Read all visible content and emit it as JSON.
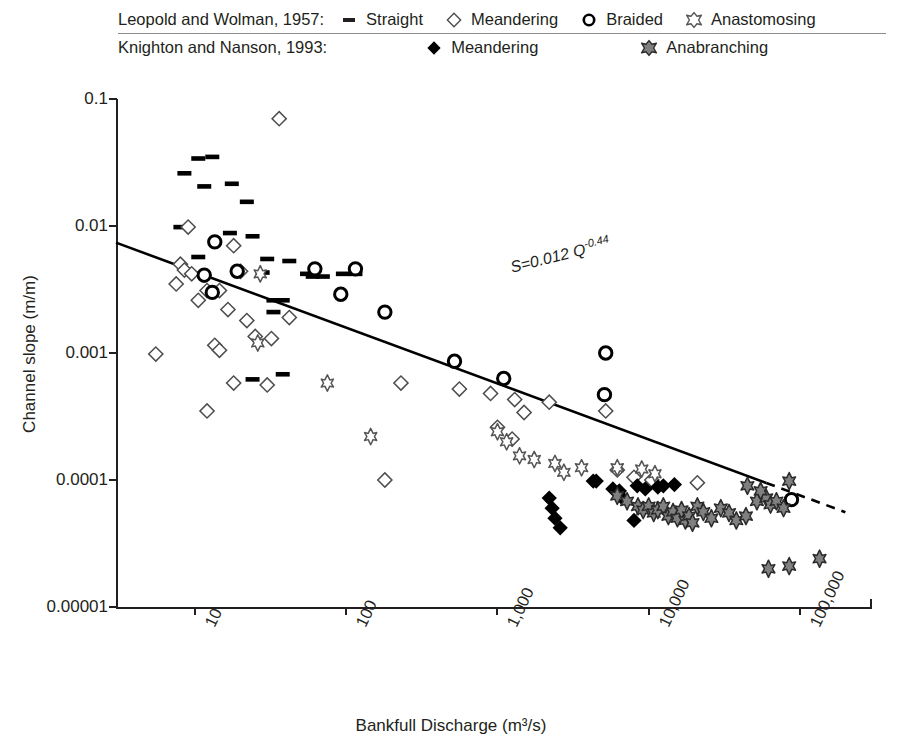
{
  "legend": {
    "rows": [
      {
        "source": "Leopold and Wolman, 1957:",
        "items": [
          {
            "marker": "straight-bar-icon",
            "label": "Straight"
          },
          {
            "marker": "open-diamond-icon",
            "label": "Meandering"
          },
          {
            "marker": "open-circle-icon",
            "label": "Braided"
          },
          {
            "marker": "open-cross-x-icon",
            "label": "Anastomosing"
          }
        ]
      },
      {
        "source": "Knighton and Nanson, 1993:",
        "items": [
          {
            "marker": "filled-diamond-icon",
            "label": "Meandering"
          },
          {
            "marker": "gray-cross-x-icon",
            "label": "Anabranching"
          }
        ]
      }
    ]
  },
  "annotation": {
    "equation_main": "S=0.012 Q",
    "equation_exponent": "-0.44"
  },
  "colors": {
    "ink": "#231f20",
    "gray_marker": "#808080",
    "axis": "#231f20"
  },
  "chart_data": {
    "type": "scatter",
    "title": "",
    "xlabel": "Bankfull Discharge (m³/s)",
    "ylabel": "Channel slope (m/m)",
    "xscale": "log",
    "yscale": "log",
    "xlim": [
      3,
      300000
    ],
    "ylim": [
      1e-05,
      0.1
    ],
    "xticks": [
      10,
      100,
      1000,
      10000,
      100000
    ],
    "xticklabels": [
      "10",
      "100",
      "1,000",
      "10,000",
      "100,000"
    ],
    "yticks": [
      0.1,
      0.01,
      0.001,
      0.0001,
      1e-05
    ],
    "yticklabels": [
      "0.1",
      "0.01",
      "0.001",
      "0.0001",
      "0.00001"
    ],
    "grid": false,
    "legend_position": "top",
    "trendline": {
      "label": "S=0.012 Q^-0.44",
      "coefficient": 0.012,
      "exponent": -0.44,
      "solid_x_range": [
        3,
        60000
      ],
      "dashed_x_range": [
        60000,
        200000
      ]
    },
    "series": [
      {
        "name": "Straight",
        "source": "Leopold and Wolman, 1957",
        "marker": "straight-bar-icon",
        "points": [
          [
            8.5,
            0.026
          ],
          [
            10.5,
            0.034
          ],
          [
            13.0,
            0.035
          ],
          [
            11.5,
            0.0205
          ],
          [
            17.5,
            0.0215
          ],
          [
            22.0,
            0.0155
          ],
          [
            8.0,
            0.0098
          ],
          [
            17.0,
            0.0088
          ],
          [
            24.0,
            0.0083
          ],
          [
            10.5,
            0.0057
          ],
          [
            30.0,
            0.0055
          ],
          [
            42.0,
            0.0053
          ],
          [
            28.0,
            0.0043
          ],
          [
            55.0,
            0.0042
          ],
          [
            70.0,
            0.004
          ],
          [
            13.0,
            0.003
          ],
          [
            60.0,
            0.004
          ],
          [
            95.0,
            0.0042
          ],
          [
            33.0,
            0.0026
          ],
          [
            38.0,
            0.0026
          ],
          [
            33.0,
            0.0021
          ],
          [
            24.0,
            0.00062
          ],
          [
            38.0,
            0.00068
          ],
          [
            115.0,
            0.0042
          ]
        ]
      },
      {
        "name": "Meandering",
        "source": "Leopold and Wolman, 1957",
        "marker": "open-diamond-icon",
        "points": [
          [
            36.0,
            0.07
          ],
          [
            9.0,
            0.0098
          ],
          [
            18.0,
            0.007
          ],
          [
            8.0,
            0.005
          ],
          [
            8.5,
            0.0045
          ],
          [
            9.5,
            0.0042
          ],
          [
            20.0,
            0.0044
          ],
          [
            7.5,
            0.0035
          ],
          [
            12.0,
            0.0031
          ],
          [
            14.5,
            0.0031
          ],
          [
            10.5,
            0.0026
          ],
          [
            16.5,
            0.0022
          ],
          [
            22.0,
            0.0018
          ],
          [
            42.0,
            0.0019
          ],
          [
            13.5,
            0.00115
          ],
          [
            14.5,
            0.00105
          ],
          [
            5.5,
            0.00098
          ],
          [
            25.0,
            0.00135
          ],
          [
            32.0,
            0.0013
          ],
          [
            18.0,
            0.00058
          ],
          [
            30.0,
            0.00056
          ],
          [
            12.0,
            0.00035
          ],
          [
            180.0,
            0.0001
          ],
          [
            230.0,
            0.00058
          ],
          [
            560.0,
            0.00052
          ],
          [
            900.0,
            0.00048
          ],
          [
            1300.0,
            0.00043
          ],
          [
            1500.0,
            0.00034
          ],
          [
            2200.0,
            0.00041
          ],
          [
            5200.0,
            0.00035
          ],
          [
            1000.0,
            0.00026
          ],
          [
            1250.0,
            0.00021
          ],
          [
            6200.0,
            0.00012
          ],
          [
            8000.0,
            0.000105
          ],
          [
            10500.0,
            0.0001
          ],
          [
            21000.0,
            9.5e-05
          ]
        ]
      },
      {
        "name": "Braided",
        "source": "Leopold and Wolman, 1957",
        "marker": "open-circle-icon",
        "points": [
          [
            13.5,
            0.0075
          ],
          [
            19.0,
            0.0044
          ],
          [
            13.0,
            0.003
          ],
          [
            11.5,
            0.0041
          ],
          [
            62.0,
            0.0046
          ],
          [
            115.0,
            0.0046
          ],
          [
            180.0,
            0.0021
          ],
          [
            92.0,
            0.0029
          ],
          [
            520.0,
            0.00086
          ],
          [
            1100.0,
            0.00063
          ],
          [
            5200.0,
            0.001
          ],
          [
            5100.0,
            0.00047
          ],
          [
            88000.0,
            7e-05
          ]
        ]
      },
      {
        "name": "Anastomosing",
        "source": "Leopold and Wolman, 1957",
        "marker": "open-cross-x-icon",
        "points": [
          [
            27.0,
            0.0042
          ],
          [
            26.0,
            0.0012
          ],
          [
            75.0,
            0.00058
          ],
          [
            145.0,
            0.00022
          ],
          [
            1000.0,
            0.00024
          ],
          [
            1150.0,
            0.0002
          ],
          [
            1400.0,
            0.000155
          ],
          [
            1750.0,
            0.000145
          ],
          [
            2400.0,
            0.000135
          ],
          [
            2750.0,
            0.000115
          ],
          [
            3600.0,
            0.000125
          ],
          [
            6200.0,
            0.000125
          ],
          [
            9000.0,
            0.000122
          ],
          [
            11000.0,
            0.000112
          ]
        ]
      },
      {
        "name": "Meandering",
        "source": "Knighton and Nanson, 1993",
        "marker": "filled-diamond-icon",
        "points": [
          [
            2200.0,
            7.2e-05
          ],
          [
            2300.0,
            6e-05
          ],
          [
            2400.0,
            5e-05
          ],
          [
            2600.0,
            4.2e-05
          ],
          [
            4300.0,
            9.8e-05
          ],
          [
            4500.0,
            9.8e-05
          ],
          [
            5800.0,
            8.5e-05
          ],
          [
            6400.0,
            8.2e-05
          ],
          [
            6700.0,
            7.2e-05
          ],
          [
            8400.0,
            9e-05
          ],
          [
            9500.0,
            8.5e-05
          ],
          [
            11500.0,
            8.8e-05
          ],
          [
            12500.0,
            9e-05
          ],
          [
            14800.0,
            9.2e-05
          ],
          [
            8000.0,
            4.8e-05
          ]
        ]
      },
      {
        "name": "Anabranching",
        "source": "Knighton and Nanson, 1993",
        "marker": "gray-cross-x-icon",
        "points": [
          [
            6200.0,
            7.5e-05
          ],
          [
            7200.0,
            6.8e-05
          ],
          [
            8500.0,
            6.2e-05
          ],
          [
            9200.0,
            5.8e-05
          ],
          [
            10000.0,
            6.2e-05
          ],
          [
            10800.0,
            5.5e-05
          ],
          [
            11500.0,
            5.8e-05
          ],
          [
            12500.0,
            6.2e-05
          ],
          [
            13500.0,
            5.2e-05
          ],
          [
            14500.0,
            5.6e-05
          ],
          [
            15500.0,
            5e-05
          ],
          [
            16500.0,
            5.8e-05
          ],
          [
            17500.0,
            4.8e-05
          ],
          [
            18500.0,
            5.2e-05
          ],
          [
            19500.0,
            4.6e-05
          ],
          [
            21000.0,
            6.2e-05
          ],
          [
            23000.0,
            5.6e-05
          ],
          [
            26000.0,
            5e-05
          ],
          [
            30000.0,
            6e-05
          ],
          [
            34000.0,
            5.5e-05
          ],
          [
            38000.0,
            4.8e-05
          ],
          [
            44000.0,
            5.2e-05
          ],
          [
            52000.0,
            6.8e-05
          ],
          [
            60000.0,
            7.2e-05
          ],
          [
            64000.0,
            6.4e-05
          ],
          [
            70000.0,
            6.8e-05
          ],
          [
            78000.0,
            6e-05
          ],
          [
            85000.0,
            9.8e-05
          ],
          [
            45000.0,
            9e-05
          ],
          [
            55000.0,
            8.2e-05
          ],
          [
            62000.0,
            2e-05
          ],
          [
            85000.0,
            2.1e-05
          ],
          [
            135000.0,
            2.4e-05
          ]
        ]
      }
    ]
  }
}
